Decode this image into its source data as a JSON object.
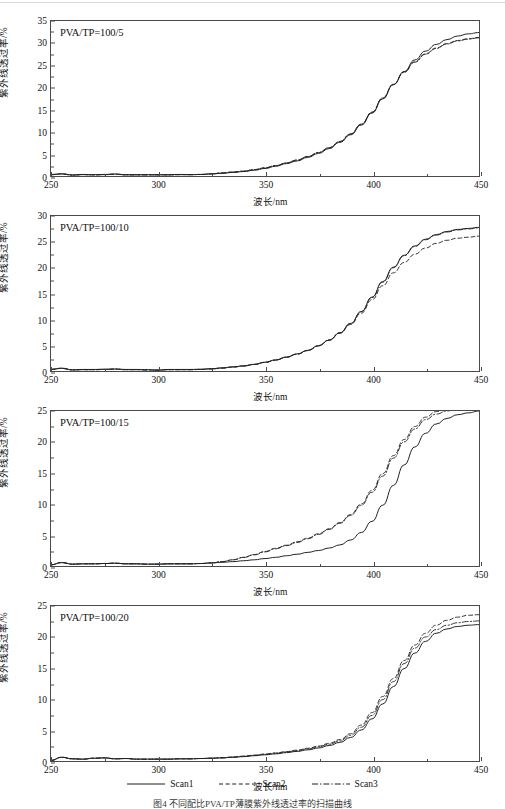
{
  "figure": {
    "caption": "图4    不同配比PVA/TP薄膜紫外线透过率的扫描曲线",
    "xlabel": "波长/nm",
    "ylabel": "紫外线透过率/%",
    "xticks": [
      250,
      300,
      350,
      400,
      450
    ],
    "xlim": [
      250,
      450
    ]
  },
  "legend": {
    "position": "bottom-center",
    "entries": [
      {
        "label": "Scan1",
        "style": "solid"
      },
      {
        "label": "Scan2",
        "style": "dashed"
      },
      {
        "label": "Scan3",
        "style": "dash-dot"
      }
    ]
  },
  "chart_data": [
    {
      "type": "line",
      "panel_label": "PVA/TP=100/5",
      "title": "",
      "xlabel": "波长/nm",
      "ylabel": "紫外线透过率/%",
      "xlim": [
        250,
        450
      ],
      "ylim": [
        0,
        35
      ],
      "yticks": [
        0,
        5,
        10,
        15,
        20,
        25,
        30,
        35
      ],
      "xticks": [
        250,
        300,
        350,
        400,
        450
      ],
      "grid": false,
      "x": [
        250,
        255,
        260,
        265,
        270,
        275,
        280,
        285,
        290,
        295,
        300,
        305,
        310,
        315,
        320,
        325,
        330,
        335,
        340,
        345,
        350,
        355,
        360,
        365,
        370,
        375,
        380,
        385,
        390,
        395,
        400,
        405,
        410,
        415,
        420,
        425,
        430,
        435,
        440,
        445,
        450
      ],
      "series": [
        {
          "name": "Scan1",
          "style": "solid",
          "values": [
            0.35,
            0.5,
            0.25,
            0.35,
            0.3,
            0.35,
            0.45,
            0.3,
            0.3,
            0.3,
            0.3,
            0.3,
            0.35,
            0.3,
            0.35,
            0.45,
            0.6,
            0.8,
            1.0,
            1.3,
            1.7,
            2.2,
            2.8,
            3.4,
            4.2,
            5.1,
            6.2,
            7.6,
            9.3,
            11.5,
            14.2,
            17.4,
            20.6,
            23.6,
            26.2,
            28.2,
            29.7,
            30.8,
            31.6,
            32.1,
            32.4
          ]
        },
        {
          "name": "Scan2",
          "style": "dashed",
          "values": [
            0.3,
            0.45,
            0.2,
            0.3,
            0.25,
            0.3,
            0.4,
            0.25,
            0.25,
            0.25,
            0.25,
            0.25,
            0.3,
            0.3,
            0.35,
            0.5,
            0.7,
            0.9,
            1.1,
            1.45,
            1.85,
            2.35,
            2.95,
            3.6,
            4.4,
            5.3,
            6.4,
            7.8,
            9.5,
            11.7,
            14.4,
            17.6,
            20.7,
            23.5,
            25.8,
            27.6,
            28.9,
            29.9,
            30.6,
            31.0,
            31.3
          ]
        },
        {
          "name": "Scan3",
          "style": "dash-dot",
          "values": [
            0.3,
            0.45,
            0.2,
            0.3,
            0.25,
            0.3,
            0.4,
            0.25,
            0.25,
            0.25,
            0.25,
            0.25,
            0.3,
            0.3,
            0.35,
            0.5,
            0.7,
            0.9,
            1.1,
            1.45,
            1.85,
            2.35,
            2.95,
            3.6,
            4.4,
            5.3,
            6.4,
            7.8,
            9.5,
            11.7,
            14.4,
            17.6,
            20.7,
            23.4,
            25.7,
            27.5,
            28.8,
            29.8,
            30.5,
            30.9,
            31.2
          ]
        }
      ]
    },
    {
      "type": "line",
      "panel_label": "PVA/TP=100/10",
      "title": "",
      "xlabel": "波长/nm",
      "ylabel": "紫外线透过率/%",
      "xlim": [
        250,
        450
      ],
      "ylim": [
        0,
        30
      ],
      "yticks": [
        0,
        5,
        10,
        15,
        20,
        25,
        30
      ],
      "xticks": [
        250,
        300,
        350,
        400,
        450
      ],
      "grid": false,
      "x": [
        250,
        255,
        260,
        265,
        270,
        275,
        280,
        285,
        290,
        295,
        300,
        305,
        310,
        315,
        320,
        325,
        330,
        335,
        340,
        345,
        350,
        355,
        360,
        365,
        370,
        375,
        380,
        385,
        390,
        395,
        400,
        405,
        410,
        415,
        420,
        425,
        430,
        435,
        440,
        445,
        450
      ],
      "series": [
        {
          "name": "Scan1",
          "style": "solid",
          "values": [
            0.35,
            0.55,
            0.25,
            0.3,
            0.3,
            0.35,
            0.4,
            0.3,
            0.3,
            0.25,
            0.2,
            0.3,
            0.3,
            0.3,
            0.35,
            0.45,
            0.6,
            0.8,
            1.0,
            1.3,
            1.7,
            2.15,
            2.7,
            3.3,
            4.0,
            4.9,
            6.0,
            7.4,
            9.2,
            11.5,
            14.3,
            17.3,
            20.1,
            22.4,
            24.2,
            25.5,
            26.4,
            27.0,
            27.4,
            27.6,
            27.8
          ]
        },
        {
          "name": "Scan2",
          "style": "dashed",
          "values": [
            0.3,
            0.5,
            0.2,
            0.25,
            0.25,
            0.3,
            0.35,
            0.25,
            0.25,
            0.2,
            0.15,
            0.25,
            0.25,
            0.25,
            0.3,
            0.4,
            0.55,
            0.75,
            0.95,
            1.25,
            1.65,
            2.1,
            2.65,
            3.25,
            3.95,
            4.85,
            5.95,
            7.3,
            9.0,
            11.2,
            13.8,
            16.5,
            19.0,
            21.0,
            22.6,
            23.8,
            24.7,
            25.3,
            25.7,
            25.9,
            26.1
          ]
        },
        {
          "name": "Scan3",
          "style": "dash-dot",
          "values": [
            0.3,
            0.5,
            0.2,
            0.25,
            0.25,
            0.3,
            0.35,
            0.25,
            0.25,
            0.2,
            0.15,
            0.25,
            0.25,
            0.25,
            0.3,
            0.4,
            0.58,
            0.78,
            0.98,
            1.28,
            1.68,
            2.12,
            2.68,
            3.28,
            4.0,
            4.9,
            6.0,
            7.4,
            9.2,
            11.5,
            14.2,
            17.2,
            20.0,
            22.3,
            24.1,
            25.4,
            26.3,
            26.9,
            27.3,
            27.5,
            27.7
          ]
        }
      ]
    },
    {
      "type": "line",
      "panel_label": "PVA/TP=100/15",
      "title": "",
      "xlabel": "波长/nm",
      "ylabel": "紫外线透过率/%",
      "xlim": [
        250,
        450
      ],
      "ylim": [
        0,
        25
      ],
      "yticks": [
        0,
        5,
        10,
        15,
        20,
        25
      ],
      "xticks": [
        250,
        300,
        350,
        400,
        450
      ],
      "grid": false,
      "x": [
        250,
        255,
        260,
        265,
        270,
        275,
        280,
        285,
        290,
        295,
        300,
        305,
        310,
        315,
        320,
        325,
        330,
        335,
        340,
        345,
        350,
        355,
        360,
        365,
        370,
        375,
        380,
        385,
        390,
        395,
        400,
        405,
        410,
        415,
        420,
        425,
        430,
        435,
        440,
        445,
        450
      ],
      "series": [
        {
          "name": "Scan1",
          "style": "solid",
          "values": [
            0.2,
            0.55,
            0.3,
            0.35,
            0.35,
            0.4,
            0.45,
            0.35,
            0.35,
            0.3,
            0.3,
            0.35,
            0.35,
            0.35,
            0.4,
            0.5,
            0.6,
            0.7,
            0.85,
            1.0,
            1.2,
            1.4,
            1.65,
            1.9,
            2.2,
            2.5,
            2.9,
            3.4,
            4.2,
            5.4,
            7.2,
            9.8,
            13.0,
            16.3,
            19.2,
            21.4,
            22.9,
            23.8,
            24.4,
            24.7,
            25.0
          ]
        },
        {
          "name": "Scan2",
          "style": "dashed",
          "values": [
            0.2,
            0.55,
            0.3,
            0.35,
            0.35,
            0.4,
            0.45,
            0.35,
            0.35,
            0.3,
            0.3,
            0.35,
            0.35,
            0.35,
            0.4,
            0.5,
            0.7,
            1.0,
            1.4,
            1.85,
            2.35,
            2.85,
            3.35,
            3.9,
            4.5,
            5.2,
            6.0,
            7.0,
            8.3,
            10.0,
            12.2,
            14.9,
            17.8,
            20.4,
            22.5,
            24.0,
            24.9,
            25.4,
            25.8,
            26.0,
            26.1
          ]
        },
        {
          "name": "Scan3",
          "style": "dash-dot",
          "values": [
            0.2,
            0.55,
            0.3,
            0.35,
            0.35,
            0.4,
            0.45,
            0.35,
            0.35,
            0.3,
            0.3,
            0.35,
            0.35,
            0.35,
            0.4,
            0.5,
            0.7,
            1.0,
            1.38,
            1.8,
            2.28,
            2.78,
            3.28,
            3.8,
            4.4,
            5.1,
            5.9,
            6.9,
            8.15,
            9.8,
            11.9,
            14.5,
            17.4,
            20.0,
            22.1,
            23.6,
            24.5,
            25.0,
            25.4,
            25.6,
            25.7
          ]
        }
      ]
    },
    {
      "type": "line",
      "panel_label": "PVA/TP=100/20",
      "title": "",
      "xlabel": "波长/nm",
      "ylabel": "紫外线透过率/%",
      "xlim": [
        250,
        450
      ],
      "ylim": [
        0,
        25
      ],
      "yticks": [
        0,
        5,
        10,
        15,
        20,
        25
      ],
      "xticks": [
        250,
        300,
        350,
        400,
        450
      ],
      "grid": false,
      "x": [
        250,
        255,
        260,
        265,
        270,
        275,
        280,
        285,
        290,
        295,
        300,
        305,
        310,
        315,
        320,
        325,
        330,
        335,
        340,
        345,
        350,
        355,
        360,
        365,
        370,
        375,
        380,
        385,
        390,
        395,
        400,
        405,
        410,
        415,
        420,
        425,
        430,
        435,
        440,
        445,
        450
      ],
      "series": [
        {
          "name": "Scan1",
          "style": "solid",
          "values": [
            0.1,
            0.6,
            0.35,
            0.3,
            0.45,
            0.5,
            0.35,
            0.4,
            0.3,
            0.3,
            0.3,
            0.3,
            0.35,
            0.35,
            0.4,
            0.45,
            0.5,
            0.6,
            0.7,
            0.85,
            1.0,
            1.15,
            1.35,
            1.55,
            1.8,
            2.1,
            2.5,
            3.0,
            3.8,
            5.0,
            6.8,
            9.2,
            12.0,
            14.9,
            17.4,
            19.3,
            20.6,
            21.3,
            21.7,
            21.9,
            22.0
          ]
        },
        {
          "name": "Scan2",
          "style": "dashed",
          "values": [
            0.1,
            0.6,
            0.35,
            0.3,
            0.45,
            0.5,
            0.35,
            0.4,
            0.3,
            0.3,
            0.3,
            0.3,
            0.35,
            0.35,
            0.4,
            0.45,
            0.52,
            0.65,
            0.78,
            0.95,
            1.12,
            1.3,
            1.52,
            1.75,
            2.05,
            2.4,
            2.85,
            3.45,
            4.4,
            5.8,
            7.8,
            10.4,
            13.3,
            16.2,
            18.7,
            20.6,
            21.9,
            22.7,
            23.2,
            23.5,
            23.6
          ]
        },
        {
          "name": "Scan3",
          "style": "dash-dot",
          "values": [
            0.1,
            0.6,
            0.35,
            0.3,
            0.45,
            0.5,
            0.35,
            0.4,
            0.3,
            0.3,
            0.3,
            0.3,
            0.35,
            0.35,
            0.4,
            0.45,
            0.52,
            0.63,
            0.75,
            0.9,
            1.08,
            1.25,
            1.45,
            1.68,
            1.95,
            2.28,
            2.7,
            3.25,
            4.15,
            5.45,
            7.35,
            9.9,
            12.8,
            15.7,
            18.2,
            20.0,
            21.2,
            21.9,
            22.3,
            22.5,
            22.6
          ]
        }
      ]
    }
  ]
}
